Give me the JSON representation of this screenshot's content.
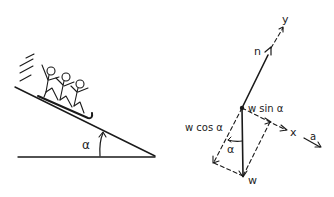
{
  "left_figure": {
    "description": "Sledders on an inclined plane",
    "angle_label": "α"
  },
  "right_figure": {
    "description": "Free-body force diagram",
    "labels": {
      "normal_force": "n",
      "y_axis": "y",
      "x_axis": "x",
      "acceleration": "a",
      "weight": "w",
      "weight_parallel": "w sin α",
      "weight_perpendicular": "w cos α",
      "angle": "α"
    }
  },
  "colors": {
    "ink": "#1a1a1a",
    "background": "#ffffff"
  }
}
